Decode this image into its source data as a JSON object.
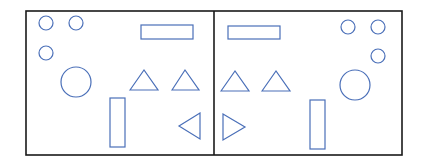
{
  "diagram": {
    "width": 423,
    "height": 168,
    "frame": {
      "x": 26,
      "y": 11,
      "width": 376,
      "height": 144,
      "stroke": "#1a1a1a",
      "stroke_width": 1.6
    },
    "divider": {
      "x": 214,
      "y1": 11,
      "y2": 155,
      "stroke": "#1a1a1a",
      "stroke_width": 1.6
    },
    "shape_stroke": "#4a6fb8",
    "shape_stroke_width": 1.2,
    "left_panel": {
      "small_circles": [
        {
          "cx": 46,
          "cy": 23,
          "r": 7
        },
        {
          "cx": 76,
          "cy": 23,
          "r": 7
        },
        {
          "cx": 46,
          "cy": 53,
          "r": 7
        }
      ],
      "large_circle": {
        "cx": 76,
        "cy": 82,
        "r": 15
      },
      "wide_rect": {
        "x": 141,
        "y": 25,
        "width": 52,
        "height": 14
      },
      "triangles_up": [
        {
          "points": "130,90 144,70 158,90"
        },
        {
          "points": "172,90 185,70 199,90"
        }
      ],
      "tall_rect": {
        "x": 110,
        "y": 98,
        "width": 15,
        "height": 49
      },
      "triangle_side": {
        "direction": "left",
        "points": "200,113 179,126 200,139"
      }
    },
    "right_panel": {
      "small_circles": [
        {
          "cx": 348,
          "cy": 27,
          "r": 7
        },
        {
          "cx": 378,
          "cy": 27,
          "r": 7
        },
        {
          "cx": 378,
          "cy": 56,
          "r": 7
        }
      ],
      "large_circle": {
        "cx": 355,
        "cy": 85,
        "r": 15
      },
      "wide_rect": {
        "x": 228,
        "y": 26,
        "width": 52,
        "height": 13
      },
      "triangles_up": [
        {
          "points": "221,91 235,71 249,91"
        },
        {
          "points": "262,91 276,71 290,91"
        }
      ],
      "tall_rect": {
        "x": 310,
        "y": 100,
        "width": 15,
        "height": 49
      },
      "triangle_side": {
        "direction": "right",
        "points": "223,114 245,127 223,140"
      }
    }
  }
}
